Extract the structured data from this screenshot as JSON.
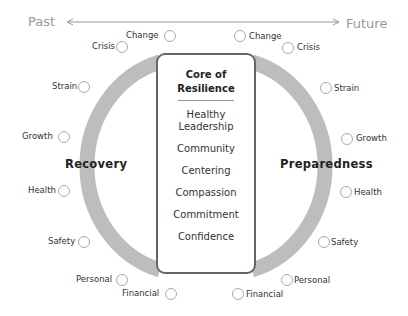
{
  "timeline": {
    "past_label": "Past",
    "future_label": "Future"
  },
  "core": {
    "title_line1": "Core of",
    "title_line2": "Resilience",
    "items": [
      "Healthy Leadership",
      "Community",
      "Centering",
      "Compassion",
      "Commitment",
      "Confidence"
    ]
  },
  "recovery": {
    "label": "Recovery",
    "items": [
      "Change",
      "Crisis",
      "Strain",
      "Growth",
      "Health",
      "Safety",
      "Personal",
      "Financial"
    ]
  },
  "preparedness": {
    "label": "Preparedness",
    "items": [
      "Change",
      "Crisis",
      "Strain",
      "Growth",
      "Health",
      "Safety",
      "Personal",
      "Financial"
    ]
  },
  "colors": {
    "arc": "#bdbdbd",
    "core_border": "#666666",
    "circle": "#aaaaaa",
    "timeline": "#999999"
  }
}
